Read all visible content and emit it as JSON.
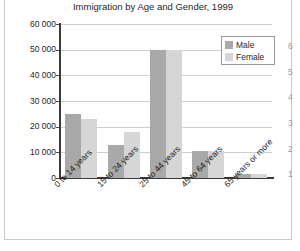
{
  "chart_data": {
    "type": "bar",
    "title": "Immigration by Age and Gender, 1999",
    "xlabel": "",
    "ylabel": "",
    "categories": [
      "0 to 14 years",
      "15 to 24 years",
      "25 to 44 years",
      "45 to 64 years",
      "65 years or more"
    ],
    "series": [
      {
        "name": "Male",
        "values": [
          25000,
          13000,
          50000,
          10500,
          1500
        ],
        "color": "#a9a9a9"
      },
      {
        "name": "Female",
        "values": [
          23000,
          18000,
          50000,
          10500,
          1500
        ],
        "color": "#d6d6d6"
      }
    ],
    "ylim": [
      0,
      60000
    ],
    "yticks": [
      0,
      10000,
      20000,
      30000,
      40000,
      50000,
      60000
    ],
    "ytick_labels": [
      "0",
      "10 000",
      "20 000",
      "30 000",
      "40 000",
      "50 000",
      "60 000"
    ],
    "grid": true,
    "legend_position": "top-right"
  },
  "legend": {
    "entries": [
      {
        "label": "Male",
        "color": "#a9a9a9"
      },
      {
        "label": "Female",
        "color": "#d6d6d6"
      }
    ]
  },
  "neighbor_chart": {
    "partial_ytick_labels": [
      "6",
      "5",
      "4",
      "3",
      "2",
      "1"
    ]
  }
}
